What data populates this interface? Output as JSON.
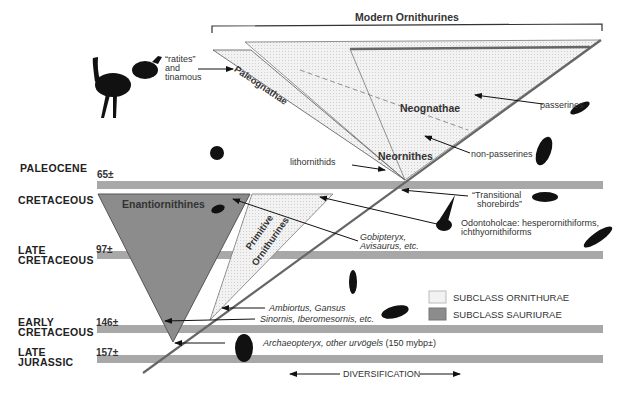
{
  "title": "Modern Ornithurines",
  "eras": [
    {
      "name": "PALEOCENE",
      "age": "65±"
    },
    {
      "name": "CRETACEOUS",
      "age": ""
    },
    {
      "name": "LATE\nCRETACEOUS",
      "line1": "LATE",
      "line2": "CRETACEOUS",
      "age": "97±"
    },
    {
      "name": "EARLY\nCRETACEOUS",
      "line1": "EARLY",
      "line2": "CRETACEOUS",
      "age": "146±"
    },
    {
      "name": "LATE\nJURASSIC",
      "line1": "LATE",
      "line2": "JURASSIC",
      "age": "157±"
    }
  ],
  "clades": {
    "paleognathae": "Paleognathae",
    "neognathae": "Neognathae",
    "neornithes": "Neornithes",
    "enantiornithines": "Enantiornithines",
    "primitive_1": "Primitive",
    "primitive_2": "Ornithurines"
  },
  "annotations": {
    "ratites_1": "“ratites”",
    "ratites_2": "and",
    "ratites_3": "tinamous",
    "lithornithids": "lithornithids",
    "passerines": "passerines",
    "non_passerines": "non-passerines",
    "transitional_1": "“Transitional",
    "transitional_2": "shorebirds”",
    "odontoholcae_1": "Odontoholcae: hesperornithiforms,",
    "odontoholcae_2": "ichthyornithiforms",
    "gobipteryx_1": "Gobipteryx,",
    "gobipteryx_2": "Avisaurus, etc.",
    "ambiortus": "Ambiortus, Gansus",
    "sinornis": "Sinornis, Iberomesornis, etc.",
    "archaeopteryx_it": "Archaeopteryx, other urvögels",
    "archaeopteryx_rest": " (150 mybp±)"
  },
  "legend": [
    {
      "label": "SUBCLASS ORNITHURAE",
      "color": "#f0f0f0"
    },
    {
      "label": "SUBCLASS SAURIURAE",
      "color": "#8c8c8c"
    }
  ],
  "axis": {
    "label": "DIVERSIFICATION"
  },
  "colors": {
    "band": "#a8a8a8",
    "sauriurae": "#8c8c8c",
    "ornithurae": "#efefef",
    "line": "#666666"
  }
}
